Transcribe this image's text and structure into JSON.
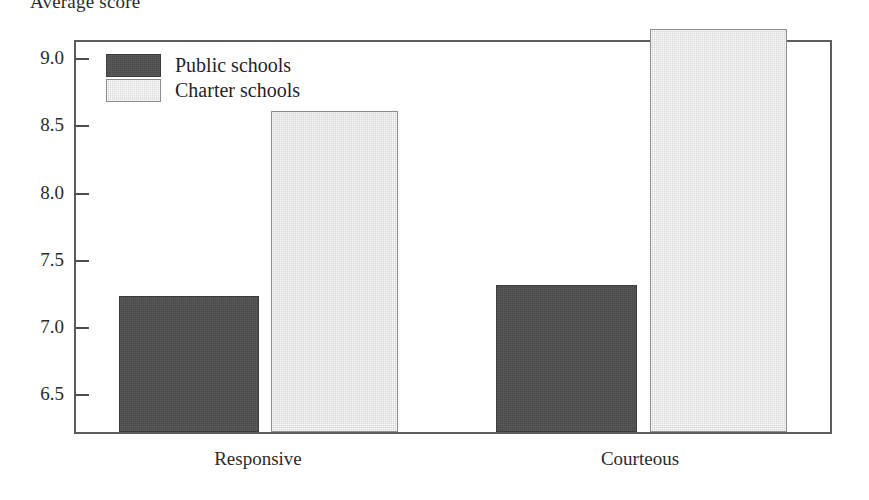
{
  "chart_data": {
    "type": "bar",
    "title": "",
    "ylabel": "Average score",
    "xlabel": "",
    "categories": [
      "Responsive",
      "Courteous"
    ],
    "series": [
      {
        "name": "Public schools",
        "color": "#4a4a4a",
        "values": [
          7.23,
          7.31
        ]
      },
      {
        "name": "Charter schools",
        "color": "#d8d8d8",
        "values": [
          8.61,
          9.22
        ]
      }
    ],
    "ylim": [
      6.22,
      9.12
    ],
    "yticks": [
      6.5,
      7.0,
      7.5,
      8.0,
      8.5,
      9.0
    ],
    "ytick_labels": [
      "6.5",
      "7.0",
      "7.5",
      "8.0",
      "8.5",
      "9.0"
    ],
    "grid": false,
    "legend_position": "top-left-inside",
    "frame": true
  },
  "axis": {
    "y_title": "Average score",
    "ticks": [
      {
        "label": "9.0",
        "value": 9.0
      },
      {
        "label": "8.5",
        "value": 8.5
      },
      {
        "label": "8.0",
        "value": 8.0
      },
      {
        "label": "7.5",
        "value": 7.5
      },
      {
        "label": "7.0",
        "value": 7.0
      },
      {
        "label": "6.5",
        "value": 6.5
      }
    ]
  },
  "legend": {
    "items": [
      {
        "label": "Public schools",
        "swatch": "dark"
      },
      {
        "label": "Charter schools",
        "swatch": "light"
      }
    ]
  },
  "categories": [
    {
      "label": "Responsive"
    },
    {
      "label": "Courteous"
    }
  ],
  "bars": [
    {
      "name": "public-responsive",
      "series": "Public schools",
      "category": "Responsive",
      "value": 7.23,
      "style": "dark"
    },
    {
      "name": "charter-responsive",
      "series": "Charter schools",
      "category": "Responsive",
      "value": 8.61,
      "style": "light"
    },
    {
      "name": "public-courteous",
      "series": "Public schools",
      "category": "Courteous",
      "value": 7.31,
      "style": "dark"
    },
    {
      "name": "charter-courteous",
      "series": "Charter schools",
      "category": "Courteous",
      "value": 9.22,
      "style": "light"
    }
  ],
  "colors": {
    "dark_fill": "#4a4a4a",
    "light_fill": "#d8d8d8",
    "frame": "#5d5d5d",
    "text": "#2b2b2b",
    "background": "#ffffff"
  }
}
